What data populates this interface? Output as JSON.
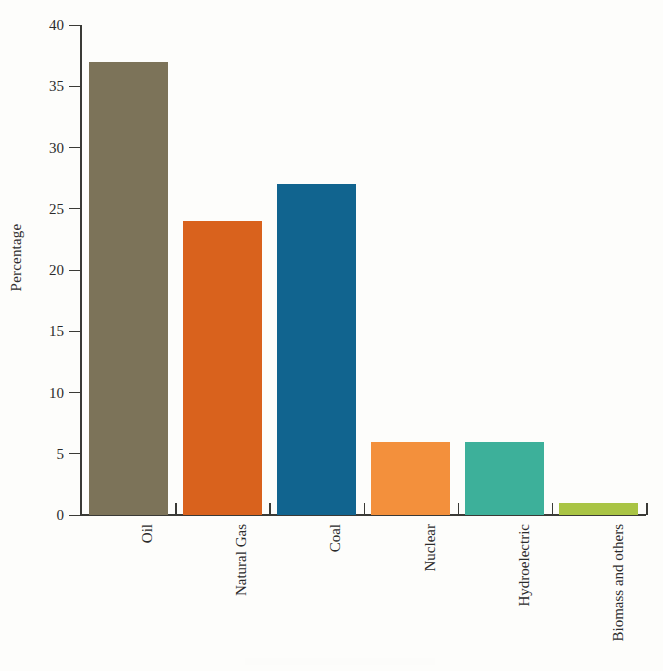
{
  "chart_data": {
    "type": "bar",
    "title": "",
    "subtitle": "",
    "xlabel": "",
    "ylabel": "Percentage",
    "ylim": [
      0,
      40
    ],
    "ytick_labels": [
      "0",
      "5",
      "10",
      "15",
      "20",
      "25",
      "30",
      "35",
      "40"
    ],
    "ytick_values": [
      0,
      5,
      10,
      15,
      20,
      25,
      30,
      35,
      40
    ],
    "grid": false,
    "legend": "none",
    "categories": [
      "Oil",
      "Natural Gas",
      "Coal",
      "Nuclear",
      "Hydroelectric",
      "Biomass and others"
    ],
    "values": [
      37,
      24,
      27,
      6,
      6,
      1
    ],
    "bar_colors": [
      "#7c7359",
      "#d9621d",
      "#11648f",
      "#f3903c",
      "#3db09a",
      "#a9c444"
    ],
    "series": [
      {
        "name": "Percentage",
        "values": [
          37,
          24,
          27,
          6,
          6,
          1
        ]
      }
    ],
    "points": [
      {
        "category": "Oil",
        "value": 37,
        "color": "#7c7359"
      },
      {
        "category": "Natural Gas",
        "value": 24,
        "color": "#d9621d"
      },
      {
        "category": "Coal",
        "value": 27,
        "color": "#11648f"
      },
      {
        "category": "Nuclear",
        "value": 6,
        "color": "#f3903c"
      },
      {
        "category": "Hydroelectric",
        "value": 6,
        "color": "#3db09a"
      },
      {
        "category": "Biomass and others",
        "value": 1,
        "color": "#a9c444"
      }
    ],
    "axis_color": "#3a3a36",
    "background_color": "#fdfdfb"
  }
}
